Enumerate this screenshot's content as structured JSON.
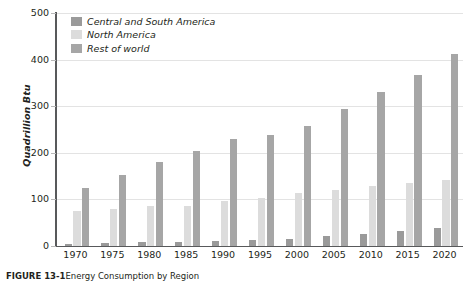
{
  "chart_data": {
    "type": "bar",
    "title": "",
    "xlabel": "",
    "ylabel": "Quadrillion Btu",
    "ylim": [
      0,
      500
    ],
    "yticks": [
      0,
      100,
      200,
      300,
      400,
      500
    ],
    "grid": true,
    "legend_position": "top-left",
    "categories": [
      "1970",
      "1975",
      "1980",
      "1985",
      "1990",
      "1995",
      "2000",
      "2005",
      "2010",
      "2015",
      "2020"
    ],
    "series": [
      {
        "name": "Central and South America",
        "color": "#9a9a9a",
        "values": [
          5,
          6,
          8,
          9,
          11,
          13,
          16,
          21,
          25,
          32,
          38
        ]
      },
      {
        "name": "North America",
        "color": "#dcdcdc",
        "values": [
          75,
          79,
          86,
          85,
          96,
          103,
          113,
          121,
          129,
          135,
          141
        ]
      },
      {
        "name": "Rest of world",
        "color": "#a6a6a6",
        "values": [
          124,
          153,
          180,
          204,
          229,
          239,
          257,
          295,
          331,
          368,
          413
        ]
      }
    ]
  },
  "caption": {
    "label": "FIGURE 13-1",
    "text": "Energy Consumption by Region"
  }
}
